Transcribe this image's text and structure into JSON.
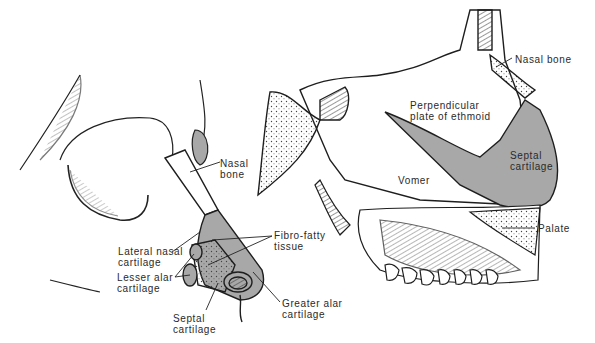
{
  "figure": {
    "left_view": {
      "labels": {
        "nasal_bone": "Nasal\nbone",
        "lateral_nasal_cartilage": "Lateral nasal\ncartilage",
        "lesser_alar_cartilage": "Lesser alar\ncartilage",
        "septal_cartilage": "Septal\ncartilage",
        "fibro_fatty_tissue": "Fibro-fatty\ntissue",
        "greater_alar_cartilage": "Greater alar\ncartilage"
      }
    },
    "right_view": {
      "labels": {
        "nasal_bone": "Nasal bone",
        "perpendicular_plate": "Perpendicular\nplate of ethmoid",
        "septal_cartilage": "Septal\ncartilage",
        "vomer": "Vomer",
        "palate": "Palate"
      }
    },
    "colors": {
      "cartilage_fill": "#a8a8a8",
      "line": "#1e1e1e",
      "background": "#ffffff"
    }
  }
}
